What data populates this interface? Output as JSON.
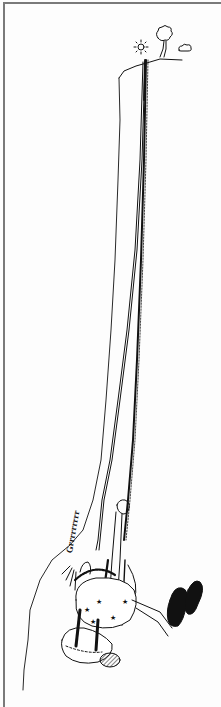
{
  "illustration": {
    "subject": "cartoon climber hanging upside-down from a rope below a cliff",
    "sound_effect_text": "Grrrrrrrrr",
    "colors": {
      "ink": "#111111",
      "paper": "#fdfdfd",
      "frame": "#7a7a7a"
    },
    "elements": [
      "sun-icon",
      "tree-icon",
      "cloud-icon",
      "cliff",
      "rope",
      "climber"
    ]
  }
}
